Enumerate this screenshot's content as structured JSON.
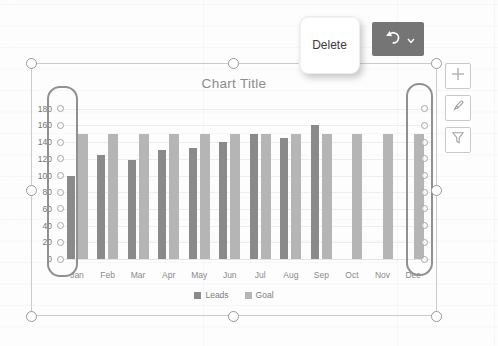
{
  "overlay": {
    "delete_key": {
      "label": "Delete",
      "kind": "keyboard-key-illustration"
    },
    "undo_button": {
      "icon": "undo-arrow-icon",
      "dropdown_icon": "chevron-down-icon",
      "bg_color": "#757575"
    }
  },
  "side_toolbar": {
    "buttons": [
      {
        "icon": "plus-icon"
      },
      {
        "icon": "paintbrush-icon"
      },
      {
        "icon": "funnel-icon"
      }
    ]
  },
  "selection": {
    "frame_border_color": "#cbcbcb",
    "handle_count": 8,
    "gridline_handle_columns": 2
  },
  "annotations": {
    "highlights": [
      {
        "name": "value-axis-gridline-handles-highlight",
        "side": "left"
      },
      {
        "name": "dec-gridline-handles-highlight",
        "side": "right"
      }
    ],
    "highlight_border_color": "#909090"
  },
  "chart_data": {
    "type": "bar",
    "title": "Chart Title",
    "xlabel": "",
    "ylabel": "",
    "categories": [
      "Jan",
      "Feb",
      "Mar",
      "Apr",
      "May",
      "Jun",
      "Jul",
      "Aug",
      "Sep",
      "Oct",
      "Nov",
      "Dec"
    ],
    "series": [
      {
        "name": "Leads",
        "color": "#8a8a8a",
        "values": [
          100,
          125,
          118,
          130,
          133,
          140,
          150,
          145,
          160,
          null,
          null,
          null
        ]
      },
      {
        "name": "Goal",
        "color": "#b5b5b5",
        "values": [
          150,
          150,
          150,
          150,
          150,
          150,
          150,
          150,
          150,
          150,
          150,
          150
        ]
      }
    ],
    "ylim": [
      0,
      180
    ],
    "ytick_step": 20,
    "yticks": [
      0,
      20,
      40,
      60,
      80,
      100,
      120,
      140,
      160,
      180
    ],
    "grid": true,
    "legend_position": "bottom",
    "title_color": "#8c8c8c",
    "axis_text_color": "#767676"
  }
}
